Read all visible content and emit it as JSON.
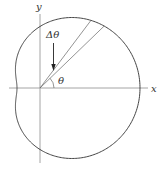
{
  "diagram": {
    "type": "polar-curve",
    "labels": {
      "y_axis": "y",
      "x_axis": "x",
      "delta_theta": "Δθ",
      "theta": "θ"
    },
    "colors": {
      "curve": "#444444",
      "axes": "#9a9a9a",
      "rays": "#666666",
      "arrow": "#222222"
    },
    "geometry": {
      "origin": [
        40,
        88
      ],
      "r_a": 61.5,
      "r_b": 38.5,
      "ray1_angle_deg": 53,
      "ray2_angle_deg": 44
    }
  }
}
